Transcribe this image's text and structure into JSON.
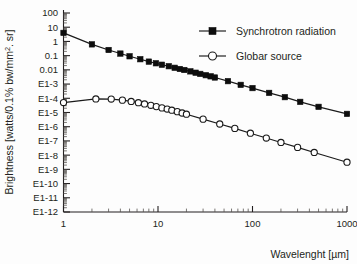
{
  "chart_data": {
    "type": "line",
    "title": "",
    "xlabel": "Wavelenght [µm]",
    "ylabel_full": "Brightness [watts/0.1% bw/mm2. sr]",
    "ylabel_prefix": "Brightness [watts/0.1% bw/mm",
    "ylabel_sup": "2",
    "ylabel_suffix": ". sr]",
    "xscale": "log",
    "yscale": "log",
    "xlim": [
      1,
      1000
    ],
    "ylim": [
      1e-12,
      100
    ],
    "grid": false,
    "legend_position": "top-right",
    "xticks": [
      1,
      10,
      100,
      1000
    ],
    "xticklabels": [
      "1",
      "10",
      "100",
      "1000"
    ],
    "yticks": [
      100,
      10,
      1,
      0.1,
      0.01,
      0.001,
      0.0001,
      1e-05,
      1e-06,
      1e-07,
      1e-08,
      1e-09,
      1e-10,
      1e-11,
      1e-12
    ],
    "yticklabels": [
      "100",
      "10",
      "1",
      "0.1",
      "0.01",
      "E1-3",
      "E1-4",
      "E1-5",
      "E1-6",
      "E1-7",
      "E1-8",
      "E1-9",
      "E1-10",
      "E1-11",
      "E1-12"
    ],
    "series": [
      {
        "name": "Synchrotron radiation",
        "marker": "filled-square",
        "x": [
          1.0,
          2.0,
          3.0,
          4.0,
          5.0,
          6.5,
          8.0,
          9.5,
          11.0,
          13.0,
          15.0,
          17.0,
          19.0,
          22.0,
          25.0,
          28.0,
          32.0,
          36.0,
          40.0,
          55.0,
          75.0,
          100.0,
          150.0,
          220.0,
          320.0,
          500.0,
          1000.0
        ],
        "y": [
          4.0,
          0.62,
          0.25,
          0.14,
          0.09,
          0.056,
          0.038,
          0.029,
          0.023,
          0.018,
          0.014,
          0.0115,
          0.0098,
          0.0078,
          0.0063,
          0.0052,
          0.0042,
          0.0035,
          0.0029,
          0.0016,
          0.00088,
          0.00052,
          0.00024,
          0.00012,
          5.6e-05,
          2.5e-05,
          8e-06
        ]
      },
      {
        "name": "Globar source",
        "marker": "open-circle",
        "x": [
          1.0,
          2.2,
          3.2,
          4.2,
          5.2,
          6.2,
          7.2,
          8.4,
          9.6,
          11.0,
          12.5,
          14.0,
          16.0,
          18.0,
          20.0,
          30.0,
          45.0,
          65.0,
          95.0,
          140.0,
          200.0,
          300.0,
          450.0,
          1000.0
        ],
        "y": [
          5e-05,
          9e-05,
          8.8e-05,
          7.4e-05,
          6e-05,
          4.9e-05,
          4e-05,
          3.2e-05,
          2.6e-05,
          2.1e-05,
          1.75e-05,
          1.45e-05,
          1.15e-05,
          9.2e-06,
          7.6e-06,
          3.4e-06,
          1.55e-06,
          7.6e-07,
          3.5e-07,
          1.6e-07,
          7.8e-08,
          3.5e-08,
          1.55e-08,
          3.2e-09
        ]
      }
    ]
  },
  "legend": {
    "entries": [
      {
        "label": "Synchrotron radiation",
        "marker": "filled-square"
      },
      {
        "label": "Globar source",
        "marker": "open-circle"
      }
    ]
  },
  "colors": {
    "foreground": "#231f20",
    "series_line": "#1a1a1a",
    "marker_fill": "#0d0d0d",
    "background": "#fdfdfd"
  }
}
